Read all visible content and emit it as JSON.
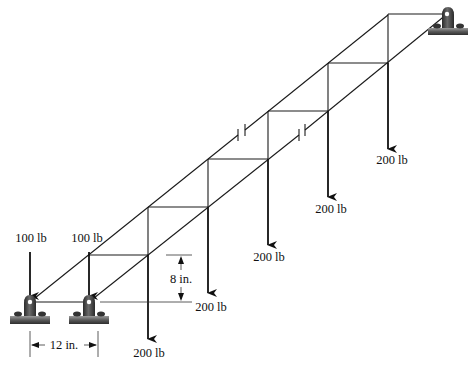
{
  "figure": {
    "type": "space truss with loads",
    "colors": {
      "line": "#1a1a1a",
      "support_dark": "#3a3a3a",
      "support_base": "#6e6e6e",
      "background": "#ffffff"
    }
  },
  "loads": [
    {
      "id": "load-A",
      "value": "100 lb",
      "x": 30,
      "y_start": 250,
      "y_end": 297,
      "label_x": 31,
      "label_y": 242
    },
    {
      "id": "load-B",
      "value": "100 lb",
      "x": 89,
      "y_start": 250,
      "y_end": 297,
      "label_x": 87,
      "label_y": 242
    },
    {
      "id": "load-1",
      "value": "200 lb",
      "x": 148,
      "y_start": 255,
      "y_end": 340,
      "label_x": 149,
      "label_y": 356
    },
    {
      "id": "load-2",
      "value": "200 lb",
      "x": 208,
      "y_start": 207,
      "y_end": 294,
      "label_x": 211,
      "label_y": 311
    },
    {
      "id": "load-3",
      "value": "200 lb",
      "x": 268,
      "y_start": 159,
      "y_end": 246,
      "label_x": 269,
      "label_y": 261
    },
    {
      "id": "load-4",
      "value": "200 lb",
      "x": 328,
      "y_start": 111,
      "y_end": 198,
      "label_x": 331,
      "label_y": 213
    },
    {
      "id": "load-5",
      "value": "200 lb",
      "x": 388,
      "y_start": 63,
      "y_end": 150,
      "label_x": 392,
      "label_y": 164
    }
  ],
  "dimensions": {
    "height": {
      "label": "8 in.",
      "x": 181,
      "y_top": 255,
      "y_bottom": 302
    },
    "width": {
      "label": "12 in.",
      "y": 346,
      "x_left": 30,
      "x_right": 98
    }
  },
  "supports": [
    {
      "id": "support-A",
      "pin_x": 30,
      "pin_y": 302
    },
    {
      "id": "support-B",
      "pin_x": 89,
      "pin_y": 302
    },
    {
      "id": "support-C",
      "pin_x": 447,
      "pin_y": 14
    }
  ]
}
